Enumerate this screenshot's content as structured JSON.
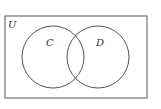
{
  "diagram": {
    "type": "venn",
    "universe_label": "U",
    "sets": [
      {
        "label": "C",
        "cx": 53,
        "cy": 57,
        "r": 31
      },
      {
        "label": "D",
        "cx": 98,
        "cy": 57,
        "r": 31
      }
    ],
    "universe_rect": {
      "x": 5,
      "y": 16,
      "width": 142,
      "height": 82
    },
    "stroke_color": "#555555",
    "background": "#ffffff"
  }
}
